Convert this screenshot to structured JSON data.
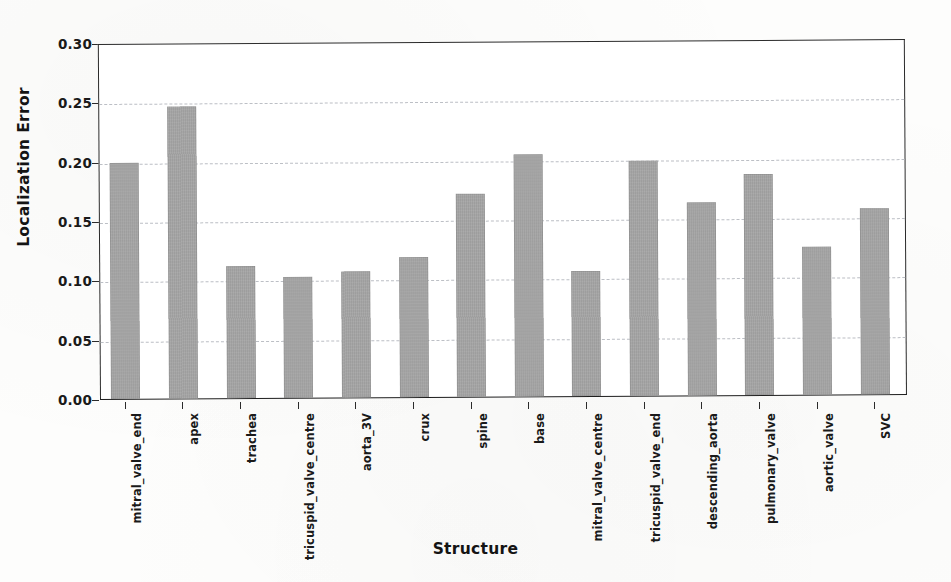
{
  "chart_data": {
    "type": "bar",
    "title": "",
    "xlabel": "Structure",
    "ylabel": "Localization Error",
    "categories": [
      "mitral_valve_end",
      "apex",
      "trachea",
      "tricuspid_valve_centre",
      "aorta_3V",
      "crux",
      "spine",
      "base",
      "mitral_valve_centre",
      "tricuspid_valve_end",
      "descending_aorta",
      "pulmonary_valve",
      "aortic_valve",
      "SVC"
    ],
    "values": [
      0.199,
      0.246,
      0.111,
      0.102,
      0.106,
      0.118,
      0.171,
      0.204,
      0.105,
      0.198,
      0.163,
      0.186,
      0.125,
      0.157
    ],
    "ylim": [
      0.0,
      0.3
    ],
    "yticks": [
      0.0,
      0.05,
      0.1,
      0.15,
      0.2,
      0.25,
      0.3
    ],
    "ytick_labels": [
      "0.00",
      "0.05",
      "0.10",
      "0.15",
      "0.20",
      "0.25",
      "0.30"
    ],
    "grid": true,
    "grid_axis": "y",
    "legend": false,
    "bar_color": "#a3a3a3",
    "axis_color": "#2b2b2b",
    "grid_color": "#b9bcc2",
    "background_color": "#ffffff"
  }
}
